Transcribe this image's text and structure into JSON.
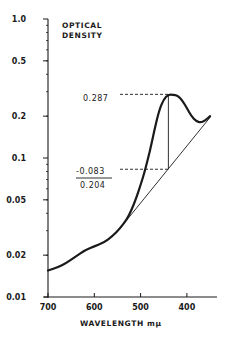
{
  "chart_data": {
    "type": "line",
    "title": "",
    "xlabel": "WAVELENGTH mμ",
    "ylabel": "OPTICAL DENSITY",
    "xscale": "linear",
    "yscale": "log",
    "xlim": [
      700,
      335
    ],
    "ylim": [
      0.01,
      1.0
    ],
    "x_ticks": [
      700,
      600,
      500,
      400
    ],
    "x_tick_labels": [
      "700",
      "600",
      "500",
      "400"
    ],
    "y_ticks": [
      1.0,
      0.5,
      0.2,
      0.1,
      0.05,
      0.02,
      0.01
    ],
    "y_tick_labels": [
      "1.0",
      "0.5",
      "0.2",
      "0.1",
      "0.05",
      "0.02",
      "0.01"
    ],
    "grid": false,
    "legend": null,
    "series": [
      {
        "name": "absorption spectrum",
        "x": [
          700,
          680,
          660,
          640,
          620,
          600,
          580,
          560,
          545,
          530,
          520,
          510,
          500,
          490,
          480,
          470,
          460,
          450,
          440,
          430,
          420,
          410,
          400,
          390,
          380,
          370,
          360,
          350
        ],
        "y": [
          0.0155,
          0.0163,
          0.0176,
          0.0196,
          0.0217,
          0.0231,
          0.0246,
          0.0275,
          0.031,
          0.036,
          0.042,
          0.051,
          0.064,
          0.082,
          0.112,
          0.16,
          0.22,
          0.265,
          0.287,
          0.285,
          0.282,
          0.26,
          0.228,
          0.2,
          0.184,
          0.18,
          0.186,
          0.2
        ]
      },
      {
        "name": "baseline",
        "x": [
          545,
          350
        ],
        "y": [
          0.031,
          0.196
        ]
      }
    ],
    "annotations": [
      {
        "text": "0.287",
        "type": "peak-value",
        "x_nm": 440,
        "od": 0.287
      },
      {
        "text": "-0.083",
        "type": "baseline-value",
        "x_nm": 440,
        "od": 0.083
      },
      {
        "text": "0.204",
        "type": "difference",
        "value": 0.204
      }
    ]
  },
  "labels": {
    "ylabel_line1": "OPTICAL",
    "ylabel_line2": "DENSITY",
    "xlabel": "WAVELENGTH  mμ",
    "peak": "0.287",
    "baseline": "-0.083",
    "difference": "0.204"
  },
  "colors": {
    "ink": "#1a1a1a",
    "background": "#ffffff"
  }
}
